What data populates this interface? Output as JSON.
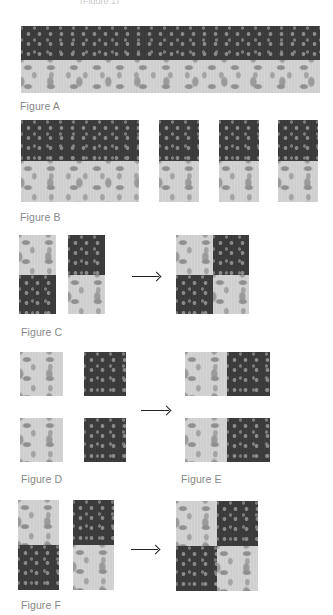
{
  "header": {
    "cut_text": "(Figure 1)"
  },
  "figures": {
    "A": {
      "label": "Figure A"
    },
    "B": {
      "label": "Figure B"
    },
    "C": {
      "label": "Figure C"
    },
    "D": {
      "label": "Figure D"
    },
    "E": {
      "label": "Figure E"
    },
    "F": {
      "label": "Figure F"
    }
  },
  "arrows": {
    "glyph": "→",
    "icon": "right-arrow-icon"
  },
  "colors": {
    "dark_fabric": "#3d3d3d",
    "light_fabric": "#cfcfcf",
    "label": "#888888",
    "arrow": "#222222"
  }
}
